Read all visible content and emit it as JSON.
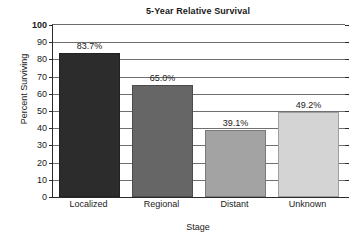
{
  "chart_data": {
    "type": "bar",
    "title": "5-Year Relative Survival",
    "xlabel": "Stage",
    "ylabel": "Percent Surviving",
    "categories": [
      "Localized",
      "Regional",
      "Distant",
      "Unknown"
    ],
    "values": [
      83.7,
      65.0,
      39.1,
      49.2
    ],
    "value_labels": [
      "83.7%",
      "65.0%",
      "39.1%",
      "49.2%"
    ],
    "bar_colors": [
      "#2c2c2c",
      "#666666",
      "#a3a3a3",
      "#d4d4d4"
    ],
    "ylim": [
      0,
      100
    ],
    "ytick_step": 10,
    "ytick_labels": [
      "100",
      "90",
      "80",
      "70",
      "60",
      "50",
      "40",
      "30",
      "20",
      "10",
      "0"
    ],
    "ytick_values": [
      100,
      90,
      80,
      70,
      60,
      50,
      40,
      30,
      20,
      10,
      0
    ],
    "grid": "horizontal",
    "legend": "none",
    "gridline_color": "#6f6f6f",
    "axis_color": "#2b2b2b",
    "plot_background": "#ffffff"
  }
}
